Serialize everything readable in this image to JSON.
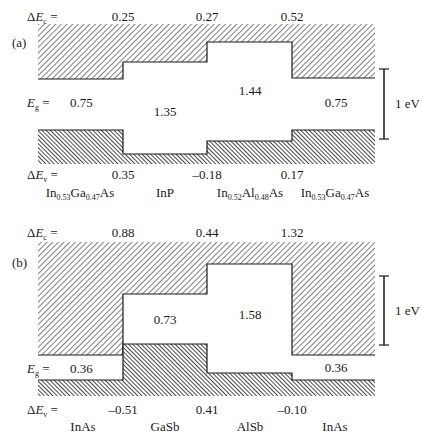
{
  "diagram": {
    "type": "band-alignment",
    "scale_label": "1 eV",
    "panels": [
      {
        "tag": "(a)",
        "delta_ec_label": "ΔE",
        "delta_ec_sub": "c",
        "delta_ec_values": [
          "0.25",
          "0.27",
          "0.52"
        ],
        "eg_label": "E",
        "eg_sub": "g",
        "eg_values": [
          "0.75",
          "1.35",
          "1.44",
          "0.75"
        ],
        "delta_ev_label": "ΔE",
        "delta_ev_sub": "v",
        "delta_ev_values": [
          "0.35",
          "–0.18",
          "0.17"
        ],
        "materials": [
          {
            "parts": [
              [
                "In",
                "0.53"
              ],
              [
                "Ga",
                "0.47"
              ],
              [
                "As",
                ""
              ]
            ]
          },
          {
            "parts": [
              [
                "InP",
                ""
              ]
            ]
          },
          {
            "parts": [
              [
                "In",
                "0.52"
              ],
              [
                "Al",
                "0.48"
              ],
              [
                "As",
                ""
              ]
            ]
          },
          {
            "parts": [
              [
                "In",
                "0.53"
              ],
              [
                "Ga",
                "0.47"
              ],
              [
                "As",
                ""
              ]
            ]
          }
        ],
        "layers": [
          {
            "name": "In0.53Ga0.47As",
            "eg": 0.75
          },
          {
            "name": "InP",
            "eg": 1.35
          },
          {
            "name": "In0.52Al0.48As",
            "eg": 1.44
          },
          {
            "name": "In0.53Ga0.47As",
            "eg": 0.75
          }
        ]
      },
      {
        "tag": "(b)",
        "delta_ec_label": "ΔE",
        "delta_ec_sub": "c",
        "delta_ec_values": [
          "0.88",
          "0.44",
          "1.32"
        ],
        "eg_label": "E",
        "eg_sub": "g",
        "eg_values": [
          "0.36",
          "0.73",
          "1.58",
          "0.36"
        ],
        "delta_ev_label": "ΔE",
        "delta_ev_sub": "v",
        "delta_ev_values": [
          "–0.51",
          "0.41",
          "–0.10"
        ],
        "materials": [
          {
            "parts": [
              [
                "InAs",
                ""
              ]
            ]
          },
          {
            "parts": [
              [
                "GaSb",
                ""
              ]
            ]
          },
          {
            "parts": [
              [
                "AlSb",
                ""
              ]
            ]
          },
          {
            "parts": [
              [
                "InAs",
                ""
              ]
            ]
          }
        ],
        "layers": [
          {
            "name": "InAs",
            "eg": 0.36
          },
          {
            "name": "GaSb",
            "eg": 0.73
          },
          {
            "name": "AlSb",
            "eg": 1.58
          },
          {
            "name": "InAs",
            "eg": 0.36
          }
        ]
      }
    ]
  }
}
